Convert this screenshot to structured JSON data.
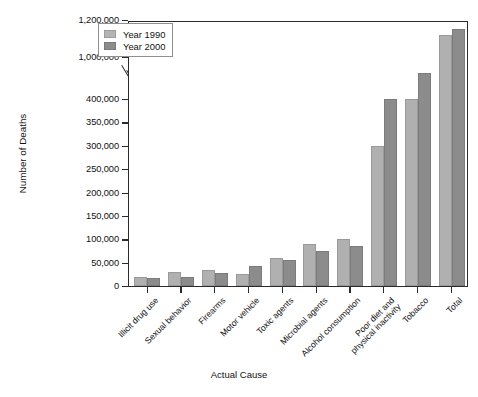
{
  "chart_data": {
    "type": "bar",
    "title": "",
    "xlabel": "Actual Cause",
    "ylabel": "Number of Deaths",
    "grid": false,
    "legend_position": "top-left",
    "axis_break": {
      "present": true,
      "between": [
        400000,
        1000000
      ]
    },
    "ylim": [
      0,
      1200000
    ],
    "ytick_labels": [
      "0",
      "50,000",
      "100,000",
      "150,000",
      "200,000",
      "250,000",
      "300,000",
      "350,000",
      "400,000",
      "1,000,000",
      "1,200,000"
    ],
    "ytick_values": [
      0,
      50000,
      100000,
      150000,
      200000,
      250000,
      300000,
      350000,
      400000,
      1000000,
      1200000
    ],
    "categories": [
      "Illicit drug use",
      "Sexual behavior",
      "Firearms",
      "Motor vehicle",
      "Toxic agents",
      "Microbial agents",
      "Alcohol consumption",
      "Poor diet and\nphysical inactivity",
      "Tobacco",
      "Total"
    ],
    "series": [
      {
        "name": "Year 1990",
        "color": "#b0b0b0",
        "values": [
          20000,
          30000,
          35000,
          25000,
          60000,
          90000,
          100000,
          300000,
          400000,
          1120000
        ]
      },
      {
        "name": "Year 2000",
        "color": "#8c8c8c",
        "values": [
          17000,
          20000,
          28000,
          43000,
          55000,
          75000,
          85000,
          400000,
          420000,
          1150000
        ]
      }
    ]
  },
  "legend": {
    "items": [
      {
        "label": "Year 1990"
      },
      {
        "label": "Year 2000"
      }
    ]
  },
  "axis": {
    "y_title": "Number of Deaths",
    "x_title": "Actual Cause"
  },
  "categories_display": [
    {
      "line1": "Illicit drug use",
      "line2": ""
    },
    {
      "line1": "Sexual behavior",
      "line2": ""
    },
    {
      "line1": "Firearms",
      "line2": ""
    },
    {
      "line1": "Motor vehicle",
      "line2": ""
    },
    {
      "line1": "Toxic agents",
      "line2": ""
    },
    {
      "line1": "Microbial agents",
      "line2": ""
    },
    {
      "line1": "Alcohol consumption",
      "line2": ""
    },
    {
      "line1": "Poor diet and",
      "line2": "physical inactivity"
    },
    {
      "line1": "Tobacco",
      "line2": ""
    },
    {
      "line1": "Total",
      "line2": ""
    }
  ]
}
